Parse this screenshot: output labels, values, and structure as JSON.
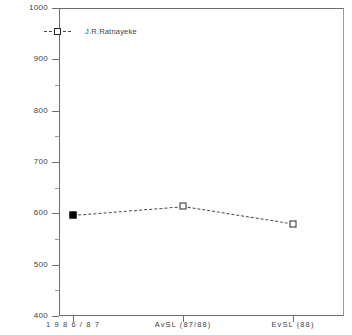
{
  "chart_data": {
    "type": "line",
    "title": "SRI LANKA DONATIONS",
    "categories": [
      "1 9 8 6 / 8 7",
      "AvSL   (87/88)",
      "EvSL   (88)"
    ],
    "series": [
      {
        "name": "J.R.Ratnayeke",
        "values": [
          597,
          614,
          580
        ],
        "marker_fill": [
          "filled",
          "open",
          "open"
        ]
      }
    ],
    "xlabel": "",
    "ylabel": "",
    "ylim": [
      400,
      1000
    ],
    "ytick_labels": [
      "400",
      "500",
      "600",
      "700",
      "800",
      "900",
      "1000"
    ],
    "ytick_values": [
      400,
      500,
      600,
      700,
      800,
      900,
      1000
    ],
    "yminor_values": [
      450,
      550,
      650,
      750,
      850,
      950
    ],
    "grid": false,
    "legend_position": "top-left",
    "line_style": "dashed",
    "colors": {
      "line": "#4a4a4a",
      "marker_open": "#ffffff",
      "marker_edge": "#262626",
      "marker_filled": "#000000",
      "axis": "#6e6e6e",
      "text": "#3f3f3f",
      "background": "#ffffff"
    }
  },
  "legend": {
    "entries": [
      {
        "label": "J.R.Ratnayeke",
        "marker": "open-square",
        "dash": "dashed"
      }
    ]
  }
}
